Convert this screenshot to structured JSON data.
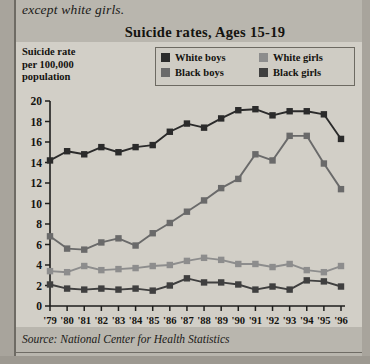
{
  "caption_above": "except white girls.",
  "figure": {
    "title": "Suicide rates,  Ages 15-19",
    "y_axis_title_lines": [
      "Suicide rate",
      "per 100,000",
      "population"
    ],
    "source": "Source: National Center for Health Statistics"
  },
  "legend": {
    "items": [
      {
        "label": "White boys",
        "color": "#2b2b2b"
      },
      {
        "label": "White girls",
        "color": "#8d8d8d"
      },
      {
        "label": "Black boys",
        "color": "#6a6a6a"
      },
      {
        "label": "Black girls",
        "color": "#3f3f3f"
      }
    ]
  },
  "chart_data": {
    "type": "line",
    "title": "Suicide rates,  Ages 15-19",
    "xlabel": "",
    "ylabel": "Suicide rate per 100,000 population",
    "ylim": [
      0,
      20
    ],
    "yticks": [
      0,
      2,
      4,
      6,
      8,
      10,
      12,
      14,
      16,
      18,
      20
    ],
    "grid": false,
    "legend_position": "top-right",
    "categories": [
      "'79",
      "'80",
      "'81",
      "'82",
      "'83",
      "'84",
      "'85",
      "'86",
      "'87",
      "'88",
      "'89",
      "'90",
      "'91",
      "'92",
      "'93",
      "'94",
      "'95",
      "'96"
    ],
    "series": [
      {
        "name": "White boys",
        "color": "#2b2b2b",
        "values": [
          14.2,
          15.1,
          14.8,
          15.5,
          15.0,
          15.5,
          15.7,
          17.0,
          17.8,
          17.4,
          18.3,
          19.1,
          19.2,
          18.6,
          19.0,
          19.0,
          18.7,
          16.3
        ]
      },
      {
        "name": "Black boys",
        "color": "#6a6a6a",
        "values": [
          6.8,
          5.6,
          5.5,
          6.2,
          6.6,
          5.9,
          7.1,
          8.1,
          9.2,
          10.3,
          11.5,
          12.4,
          14.8,
          14.2,
          16.6,
          16.6,
          13.9,
          11.4
        ]
      },
      {
        "name": "White girls",
        "color": "#8d8d8d",
        "values": [
          3.4,
          3.3,
          3.9,
          3.5,
          3.6,
          3.7,
          3.9,
          4.0,
          4.4,
          4.7,
          4.5,
          4.1,
          4.1,
          3.8,
          4.1,
          3.5,
          3.3,
          3.9
        ]
      },
      {
        "name": "Black girls",
        "color": "#3f3f3f",
        "values": [
          2.1,
          1.7,
          1.6,
          1.7,
          1.6,
          1.7,
          1.5,
          2.0,
          2.7,
          2.3,
          2.3,
          2.1,
          1.6,
          1.9,
          1.6,
          2.5,
          2.4,
          1.9
        ]
      }
    ]
  }
}
